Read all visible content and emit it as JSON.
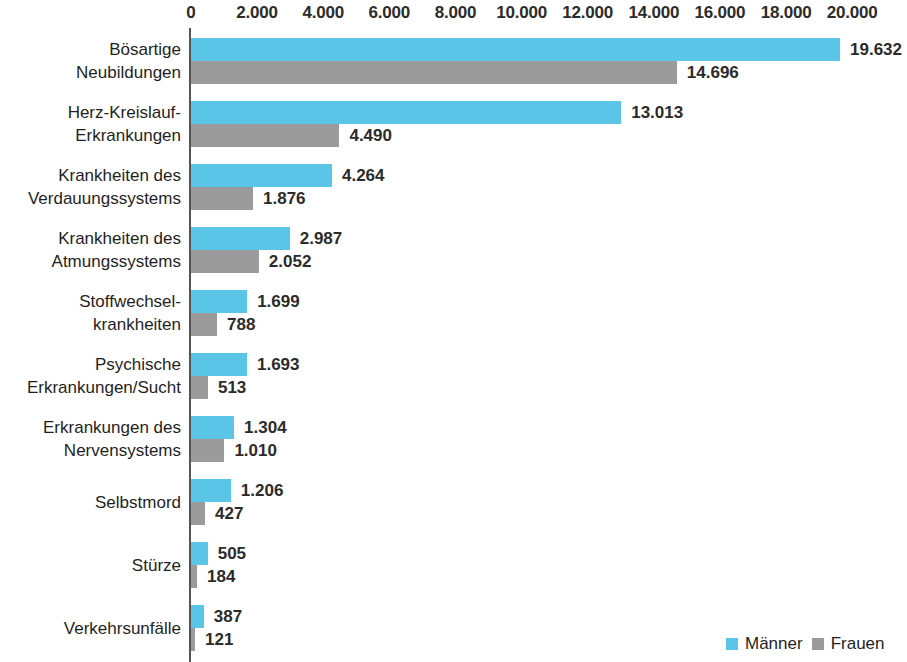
{
  "chart_data": {
    "type": "bar",
    "orientation": "horizontal",
    "grouped": true,
    "title": "",
    "subtitle": "",
    "xlabel": "",
    "ylabel": "",
    "xlim": [
      0,
      20000
    ],
    "xticks": [
      "0",
      "2.000",
      "4.000",
      "6.000",
      "8.000",
      "10.000",
      "12.000",
      "14.000",
      "16.000",
      "18.000",
      "20.000"
    ],
    "xtick_values": [
      0,
      2000,
      4000,
      6000,
      8000,
      10000,
      12000,
      14000,
      16000,
      18000,
      20000
    ],
    "grid": false,
    "legend_position": "bottom-right",
    "categories": [
      "Bösartige\nNeubildungen",
      "Herz-Kreislauf-\nErkrankungen",
      "Krankheiten des\nVerdauungssystems",
      "Krankheiten des\nAtmungssystems",
      "Stoffwechsel-\nkrankheiten",
      "Psychische\nErkrankungen/Sucht",
      "Erkrankungen des\nNervensystems",
      "Selbstmord",
      "Stürze",
      "Verkehrsunfälle"
    ],
    "series": [
      {
        "name": "Männer",
        "color": "#5bc5e8",
        "values": [
          19632,
          13013,
          4264,
          2987,
          1699,
          1693,
          1304,
          1206,
          505,
          387
        ],
        "labels": [
          "19.632",
          "13.013",
          "4.264",
          "2.987",
          "1.699",
          "1.693",
          "1.304",
          "1.206",
          "505",
          "387"
        ]
      },
      {
        "name": "Frauen",
        "color": "#9b9b9b",
        "values": [
          14696,
          4490,
          1876,
          2052,
          788,
          513,
          1010,
          427,
          184,
          121
        ],
        "labels": [
          "14.696",
          "4.490",
          "1.876",
          "2.052",
          "788",
          "513",
          "1.010",
          "427",
          "184",
          "121"
        ]
      }
    ]
  },
  "legend": {
    "items": [
      {
        "label": "Männer",
        "color": "#5bc5e8"
      },
      {
        "label": "Frauen",
        "color": "#9b9b9b"
      }
    ]
  }
}
